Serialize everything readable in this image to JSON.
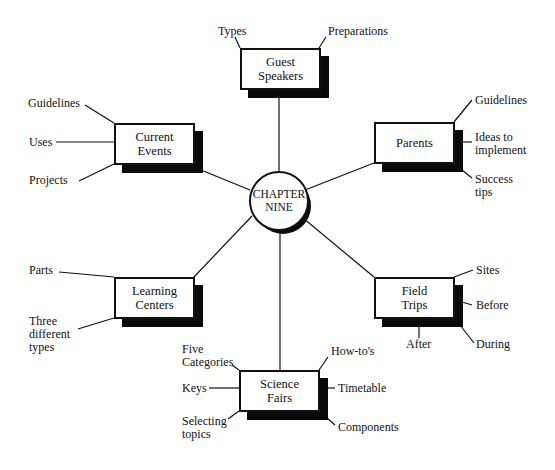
{
  "diagram": {
    "center": {
      "label": "CHAPTER\nNINE"
    },
    "nodes": {
      "guest_speakers": {
        "label": "Guest\nSpeakers",
        "subtopics": [
          "Types",
          "Preparations"
        ]
      },
      "current_events": {
        "label": "Current\nEvents",
        "subtopics": [
          "Guidelines",
          "Uses",
          "Projects"
        ]
      },
      "parents": {
        "label": "Parents",
        "subtopics": [
          "Guidelines",
          "Ideas to\nimplement",
          "Success\ntips"
        ]
      },
      "learning_centers": {
        "label": "Learning\nCenters",
        "subtopics": [
          "Parts",
          "Three\ndifferent\ntypes"
        ]
      },
      "field_trips": {
        "label": "Field\nTrips",
        "subtopics": [
          "Sites",
          "Before",
          "During",
          "After"
        ]
      },
      "science_fairs": {
        "label": "Science\nFairs",
        "subtopics": [
          "Five\nCategories",
          "Keys",
          "Selecting\ntopics",
          "How-to's",
          "Timetable",
          "Components"
        ]
      }
    },
    "colors": {
      "line": "#111111",
      "shadow": "#0a0a0a",
      "background": "#ffffff"
    }
  }
}
